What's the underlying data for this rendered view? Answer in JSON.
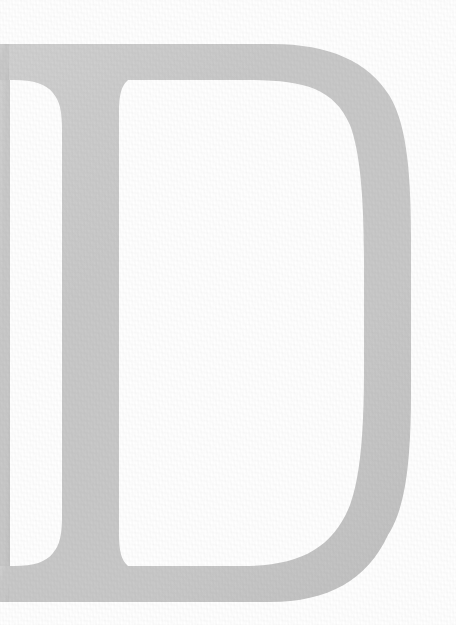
{
  "image": {
    "kind": "scanned-letterform",
    "character": "D",
    "case": "uppercase",
    "typeface_style": "serif",
    "orientation": "upright",
    "cropped": true,
    "crop_side": "left",
    "width": 456,
    "height": 625
  },
  "colors": {
    "background": "#ffffff",
    "glyph_fill": "#c9c9c9",
    "glyph_fill_light": "#d2d2d2",
    "glyph_fill_dark": "#c1c1c1",
    "glyph_edge": "#d8d8d8"
  },
  "glyph": {
    "label": "letter-d",
    "alt_text": "Large light gray serif capital letter D, cropped at the left edge",
    "bounds": {
      "left": 0,
      "top": 43,
      "right": 411,
      "bottom": 603
    },
    "stem": {
      "left": 8,
      "right": 66,
      "top": 43,
      "bottom": 603
    },
    "counter": {
      "left": 68,
      "top": 78,
      "right": 356,
      "bottom": 566
    },
    "bowl": {
      "outer_max_x": 411,
      "outer_max_x_y": 322
    },
    "serifs": {
      "top": {
        "y_start": 43,
        "y_end": 80,
        "x_start": 0,
        "x_end": 62
      },
      "bottom": {
        "y_start": 563,
        "y_end": 603,
        "x_start": 0,
        "x_end": 62
      }
    }
  },
  "texture": {
    "present": true,
    "description": "fine horizontal and vertical scan/weave grain across the inked area"
  }
}
